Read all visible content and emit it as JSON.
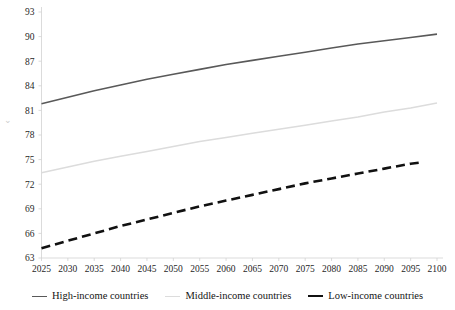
{
  "chart_data": {
    "type": "line",
    "title": "",
    "subtitle": "",
    "xlabel": "",
    "ylabel": "",
    "xlim": [
      2025,
      2100
    ],
    "ylim": [
      63,
      93
    ],
    "grid": false,
    "legend_position": "bottom",
    "x": [
      2025,
      2030,
      2035,
      2040,
      2045,
      2050,
      2055,
      2060,
      2065,
      2070,
      2075,
      2080,
      2085,
      2090,
      2095,
      2100
    ],
    "x_tick_labels": [
      "2025",
      "2030",
      "2035",
      "2040",
      "2045",
      "2050",
      "2055",
      "2060",
      "2065",
      "2070",
      "2075",
      "2080",
      "2085",
      "2090",
      "2095",
      "2100"
    ],
    "y_tick_labels": [
      "63",
      "66",
      "69",
      "72",
      "75",
      "78",
      "81",
      "84",
      "87",
      "90",
      "93"
    ],
    "y_ticks": [
      63,
      66,
      69,
      72,
      75,
      78,
      81,
      84,
      87,
      90,
      93
    ],
    "series": [
      {
        "name": "High-income countries",
        "color": "#595959",
        "width": 1.6,
        "dash": "none",
        "x_end": 2100,
        "values": [
          81.8,
          82.6,
          83.4,
          84.1,
          84.8,
          85.4,
          86.0,
          86.6,
          87.1,
          87.6,
          88.1,
          88.6,
          89.1,
          89.5,
          89.9,
          90.3
        ]
      },
      {
        "name": "Middle-income countries",
        "color": "#dcdcdc",
        "width": 1.5,
        "dash": "none",
        "x_end": 2100,
        "values": [
          73.4,
          74.1,
          74.8,
          75.4,
          76.0,
          76.6,
          77.2,
          77.7,
          78.2,
          78.7,
          79.2,
          79.7,
          80.2,
          80.8,
          81.3,
          81.9
        ]
      },
      {
        "name": "Low-income countries",
        "color": "#111111",
        "width": 2.6,
        "dash": "9 5",
        "x_end": 2097,
        "values": [
          64.2,
          65.1,
          66.0,
          66.9,
          67.7,
          68.5,
          69.3,
          70.0,
          70.7,
          71.4,
          72.1,
          72.7,
          73.3,
          73.9,
          74.5,
          74.9
        ]
      }
    ],
    "axis_stub_glyph": "⌄"
  },
  "legend": {
    "items": [
      {
        "label": "High-income countries",
        "color": "#595959",
        "width": "1.6px",
        "swatch_name": "legend-swatch-high-income"
      },
      {
        "label": "Middle-income countries",
        "color": "#dcdcdc",
        "width": "1.5px",
        "swatch_name": "legend-swatch-middle-income"
      },
      {
        "label": "Low-income countries",
        "color": "#111111",
        "width": "2.6px",
        "swatch_name": "legend-swatch-low-income"
      }
    ]
  }
}
